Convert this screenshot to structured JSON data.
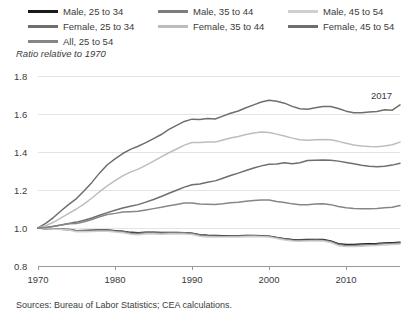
{
  "legend": {
    "columns": [
      {
        "items": [
          {
            "label": "Male, 25 to 34",
            "color": "#1a1a1a",
            "key": "male-25-34"
          },
          {
            "label": "Female, 25 to 34",
            "color": "#6e6e6e",
            "key": "female-25-34"
          },
          {
            "label": "All, 25 to 54",
            "color": "#868686",
            "key": "all-25-54"
          }
        ]
      },
      {
        "items": [
          {
            "label": "Male, 35 to 44",
            "color": "#7d7d7d",
            "key": "male-35-44"
          },
          {
            "label": "Female, 35 to 44",
            "color": "#bdbdbd",
            "key": "female-35-44"
          }
        ]
      },
      {
        "items": [
          {
            "label": "Male, 45 to 54",
            "color": "#cfcfcf",
            "key": "male-45-54"
          },
          {
            "label": "Female, 45 to 54",
            "color": "#6e6e6e",
            "key": "female-45-54"
          }
        ]
      }
    ]
  },
  "source_note": "Sources: Bureau of Labor Statistics; CEA calculations.",
  "annotation": {
    "text": "2017",
    "x_px": 371,
    "y_px": 28
  },
  "chart_data": {
    "type": "line",
    "title": "",
    "subtitle": "",
    "xlabel": "",
    "ylabel": "Ratio relative to 1970",
    "xlim": [
      1970,
      2017
    ],
    "ylim": [
      0.8,
      1.8
    ],
    "yticks": [
      0.8,
      1.0,
      1.2,
      1.4,
      1.6,
      1.8
    ],
    "ytick_labels": [
      "0.8",
      "1.0",
      "1.2",
      "1.4",
      "1.6",
      "1.8"
    ],
    "xticks": [
      1970,
      1980,
      1990,
      2000,
      2010
    ],
    "xtick_labels": [
      "1970",
      "1980",
      "1990",
      "2000",
      "2010"
    ],
    "grid": true,
    "legend_position": "top",
    "annotations": [
      {
        "text": "2017",
        "x": 2016,
        "y": 1.72
      }
    ],
    "x": [
      1970,
      1971,
      1972,
      1973,
      1974,
      1975,
      1976,
      1977,
      1978,
      1979,
      1980,
      1981,
      1982,
      1983,
      1984,
      1985,
      1986,
      1987,
      1988,
      1989,
      1990,
      1991,
      1992,
      1993,
      1994,
      1995,
      1996,
      1997,
      1998,
      1999,
      2000,
      2001,
      2002,
      2003,
      2004,
      2005,
      2006,
      2007,
      2008,
      2009,
      2010,
      2011,
      2012,
      2013,
      2014,
      2015,
      2016,
      2017
    ],
    "series": [
      {
        "name": "Male, 25 to 34",
        "color": "#1a1a1a",
        "values": [
          1.0,
          0.996,
          0.994,
          0.993,
          0.991,
          0.986,
          0.987,
          0.988,
          0.989,
          0.989,
          0.986,
          0.983,
          0.977,
          0.975,
          0.977,
          0.977,
          0.976,
          0.976,
          0.976,
          0.975,
          0.972,
          0.965,
          0.962,
          0.961,
          0.959,
          0.959,
          0.959,
          0.96,
          0.96,
          0.959,
          0.957,
          0.95,
          0.943,
          0.939,
          0.938,
          0.939,
          0.94,
          0.939,
          0.932,
          0.917,
          0.913,
          0.913,
          0.916,
          0.917,
          0.918,
          0.921,
          0.923,
          0.925
        ]
      },
      {
        "name": "Male, 35 to 44",
        "color": "#7d7d7d",
        "values": [
          1.0,
          0.997,
          0.996,
          0.995,
          0.993,
          0.985,
          0.985,
          0.986,
          0.988,
          0.988,
          0.984,
          0.981,
          0.974,
          0.972,
          0.975,
          0.975,
          0.974,
          0.975,
          0.975,
          0.975,
          0.971,
          0.963,
          0.959,
          0.958,
          0.957,
          0.958,
          0.958,
          0.959,
          0.959,
          0.958,
          0.956,
          0.949,
          0.942,
          0.937,
          0.935,
          0.936,
          0.937,
          0.936,
          0.929,
          0.913,
          0.908,
          0.908,
          0.91,
          0.912,
          0.914,
          0.917,
          0.919,
          0.921
        ]
      },
      {
        "name": "Male, 45 to 54",
        "color": "#cfcfcf",
        "values": [
          1.0,
          0.996,
          0.994,
          0.992,
          0.989,
          0.98,
          0.98,
          0.981,
          0.983,
          0.983,
          0.979,
          0.975,
          0.967,
          0.965,
          0.968,
          0.968,
          0.967,
          0.968,
          0.969,
          0.969,
          0.966,
          0.957,
          0.953,
          0.952,
          0.952,
          0.953,
          0.953,
          0.954,
          0.955,
          0.954,
          0.952,
          0.945,
          0.937,
          0.932,
          0.93,
          0.931,
          0.932,
          0.931,
          0.924,
          0.907,
          0.902,
          0.902,
          0.904,
          0.906,
          0.908,
          0.911,
          0.913,
          0.915
        ]
      },
      {
        "name": "Female, 25 to 34",
        "color": "#6e6e6e",
        "values": [
          1.0,
          1.024,
          1.055,
          1.091,
          1.124,
          1.155,
          1.196,
          1.24,
          1.29,
          1.333,
          1.364,
          1.392,
          1.414,
          1.43,
          1.449,
          1.47,
          1.492,
          1.519,
          1.54,
          1.561,
          1.573,
          1.571,
          1.576,
          1.574,
          1.589,
          1.604,
          1.616,
          1.633,
          1.648,
          1.663,
          1.672,
          1.667,
          1.657,
          1.64,
          1.628,
          1.625,
          1.633,
          1.639,
          1.639,
          1.629,
          1.615,
          1.607,
          1.606,
          1.611,
          1.613,
          1.622,
          1.62,
          1.648
        ]
      },
      {
        "name": "Female, 35 to 44",
        "color": "#bdbdbd",
        "values": [
          1.0,
          1.012,
          1.03,
          1.053,
          1.077,
          1.1,
          1.127,
          1.158,
          1.191,
          1.222,
          1.249,
          1.274,
          1.294,
          1.31,
          1.33,
          1.352,
          1.374,
          1.396,
          1.416,
          1.436,
          1.45,
          1.45,
          1.453,
          1.452,
          1.463,
          1.474,
          1.482,
          1.492,
          1.5,
          1.505,
          1.503,
          1.494,
          1.484,
          1.473,
          1.465,
          1.462,
          1.464,
          1.466,
          1.464,
          1.456,
          1.446,
          1.437,
          1.432,
          1.429,
          1.428,
          1.432,
          1.438,
          1.452
        ]
      },
      {
        "name": "Female, 45 to 54",
        "color": "#6e6e6e",
        "values": [
          1.0,
          1.003,
          1.009,
          1.016,
          1.024,
          1.031,
          1.041,
          1.053,
          1.067,
          1.081,
          1.093,
          1.105,
          1.114,
          1.123,
          1.136,
          1.15,
          1.166,
          1.183,
          1.199,
          1.215,
          1.228,
          1.232,
          1.241,
          1.248,
          1.262,
          1.276,
          1.289,
          1.303,
          1.316,
          1.327,
          1.335,
          1.337,
          1.343,
          1.338,
          1.343,
          1.355,
          1.357,
          1.358,
          1.357,
          1.352,
          1.345,
          1.338,
          1.33,
          1.325,
          1.322,
          1.325,
          1.331,
          1.341
        ]
      },
      {
        "name": "All, 25 to 54",
        "color": "#868686",
        "values": [
          1.0,
          1.002,
          1.008,
          1.016,
          1.022,
          1.024,
          1.033,
          1.045,
          1.059,
          1.071,
          1.077,
          1.084,
          1.086,
          1.088,
          1.095,
          1.102,
          1.109,
          1.117,
          1.124,
          1.131,
          1.132,
          1.126,
          1.125,
          1.124,
          1.128,
          1.133,
          1.136,
          1.141,
          1.145,
          1.147,
          1.147,
          1.14,
          1.134,
          1.127,
          1.123,
          1.123,
          1.126,
          1.127,
          1.123,
          1.113,
          1.106,
          1.102,
          1.101,
          1.101,
          1.102,
          1.106,
          1.109,
          1.118
        ]
      }
    ]
  }
}
